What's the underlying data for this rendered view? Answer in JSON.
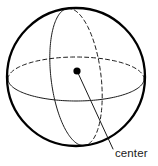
{
  "figure": {
    "kind": "geometry-diagram",
    "background_color": "#ffffff",
    "ink_color": "#1a1a1a",
    "outline_color": "#000000",
    "width": 158,
    "height": 166
  },
  "sphere": {
    "name": "sphere-outline",
    "center_x": 76,
    "center_y": 77,
    "radius": 69,
    "stroke_width": 2.3,
    "stroke_color": "#000000",
    "fill": "none"
  },
  "equator": {
    "name": "equator-ellipse",
    "rx": 68,
    "ry": 22,
    "center_x": 76,
    "center_y": 79,
    "front_half": "solid",
    "back_half": "dashed",
    "stroke_width": 1.0,
    "stroke_color": "#1a1a1a",
    "dash_pattern": "4,3"
  },
  "meridian": {
    "name": "meridian-ellipse",
    "rx": 25,
    "ry": 69,
    "center_x": 76,
    "center_y": 77,
    "rotation_deg": -7,
    "front_half": "solid",
    "back_half": "dashed",
    "stroke_width": 1.0,
    "stroke_color": "#1a1a1a",
    "dash_pattern": "4,3"
  },
  "center_point": {
    "name": "center-dot",
    "x": 77,
    "y": 71,
    "radius": 3.6,
    "fill": "#000000"
  },
  "leader_line": {
    "name": "center-leader-line",
    "x1": 78,
    "y1": 73,
    "x2": 113,
    "y2": 149,
    "stroke_width": 1.0,
    "stroke_color": "#1a1a1a"
  },
  "annotations": [
    {
      "id": "center-label",
      "text": "center",
      "x": 115,
      "y": 157,
      "font_size": 11.5,
      "anchor": "start"
    }
  ]
}
